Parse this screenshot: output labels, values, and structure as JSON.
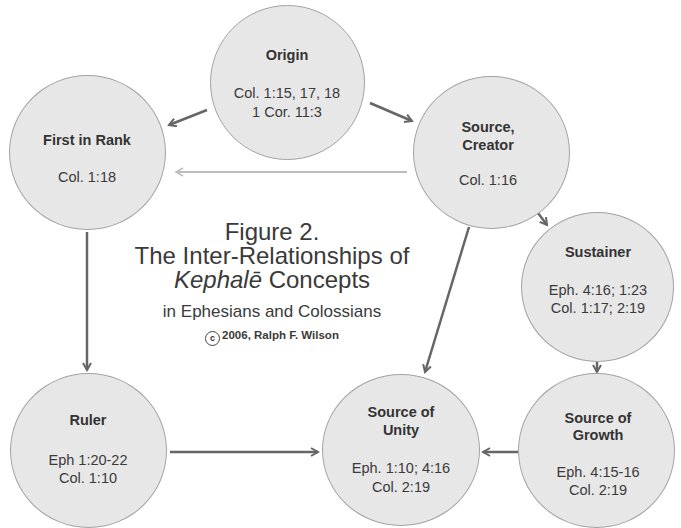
{
  "figure": {
    "number": "Figure 2.",
    "title_line1": "The Inter-Relationships of",
    "title_italic": "Kephalē",
    "title_rest": " Concepts",
    "subtitle": "in Ephesians and Colossians",
    "copyright_symbol": "c",
    "copyright": "2006, Ralph F. Wilson"
  },
  "nodes": {
    "origin": {
      "title": [
        "Origin"
      ],
      "refs": [
        "Col. 1:15, 17, 18",
        "1 Cor. 11:3"
      ]
    },
    "first_in_rank": {
      "title": [
        "First in Rank"
      ],
      "refs": [
        "Col. 1:18"
      ]
    },
    "source_creator": {
      "title": [
        "Source,",
        "Creator"
      ],
      "refs": [
        "Col. 1:16"
      ]
    },
    "sustainer": {
      "title": [
        "Sustainer"
      ],
      "refs": [
        "Eph. 4:16; 1:23",
        "Col. 1:17; 2:19"
      ]
    },
    "source_of_growth": {
      "title": [
        "Source of",
        "Growth"
      ],
      "refs": [
        "Eph. 4:15-16",
        "Col. 2:19"
      ]
    },
    "source_of_unity": {
      "title": [
        "Source of",
        "Unity"
      ],
      "refs": [
        "Eph. 1:10; 4:16",
        "Col. 2:19"
      ]
    },
    "ruler": {
      "title": [
        "Ruler"
      ],
      "refs": [
        "Eph 1:20-22",
        "Col. 1:10"
      ]
    }
  },
  "edges": [
    {
      "from": "Origin",
      "to": "First in Rank"
    },
    {
      "from": "Origin",
      "to": "Source, Creator"
    },
    {
      "from": "Source, Creator",
      "to": "First in Rank",
      "style": "light"
    },
    {
      "from": "Source, Creator",
      "to": "Sustainer"
    },
    {
      "from": "Source, Creator",
      "to": "Source of Unity"
    },
    {
      "from": "First in Rank",
      "to": "Ruler"
    },
    {
      "from": "Sustainer",
      "to": "Source of Growth"
    },
    {
      "from": "Ruler",
      "to": "Source of Unity"
    },
    {
      "from": "Source of Growth",
      "to": "Source of Unity"
    }
  ],
  "colors": {
    "node_fill": "#e7e7e7",
    "node_border": "#a3a3a3",
    "arrow": "#666666",
    "arrow_light": "#bdbdbd",
    "text": "#333333"
  }
}
